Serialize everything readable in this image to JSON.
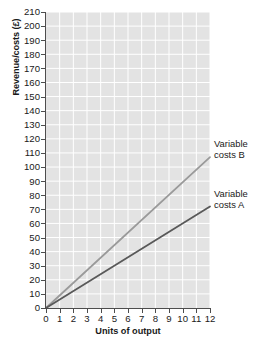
{
  "chart_data": {
    "type": "line",
    "title": "",
    "subtitle": "",
    "xlabel": "Units of output",
    "ylabel": "Revenue/costs (£)",
    "xlim": [
      0,
      12
    ],
    "ylim": [
      0,
      210
    ],
    "x_ticks": [
      0,
      1,
      2,
      3,
      4,
      5,
      6,
      7,
      8,
      9,
      10,
      11,
      12
    ],
    "y_ticks": [
      0,
      10,
      20,
      30,
      40,
      50,
      60,
      70,
      80,
      90,
      100,
      110,
      120,
      130,
      140,
      150,
      160,
      170,
      180,
      190,
      200,
      210
    ],
    "x_tick_labels": [
      "0",
      "1",
      "2",
      "3",
      "4",
      "5",
      "6",
      "7",
      "8",
      "9",
      "10",
      "11",
      "12"
    ],
    "y_tick_labels": [
      "0",
      "10",
      "20",
      "30",
      "40",
      "50",
      "60",
      "70",
      "80",
      "90",
      "100",
      "110",
      "120",
      "130",
      "140",
      "150",
      "160",
      "170",
      "180",
      "190",
      "200",
      "210"
    ],
    "grid": true,
    "grid_color": "#ffffff",
    "plot_background": "#e3e3e3",
    "axis_color": "#4d4d4d",
    "legend_position": "right-inline-annotation",
    "x": [
      0,
      12
    ],
    "series": [
      {
        "name": "Variable costs B",
        "label_lines": [
          "Variable",
          "costs B"
        ],
        "color": "#9a9a9a",
        "width": 1.8,
        "values": [
          0,
          107
        ]
      },
      {
        "name": "Variable costs A",
        "label_lines": [
          "Variable",
          "costs A"
        ],
        "color": "#595959",
        "width": 1.8,
        "values": [
          0,
          72
        ]
      }
    ],
    "annotations": []
  }
}
